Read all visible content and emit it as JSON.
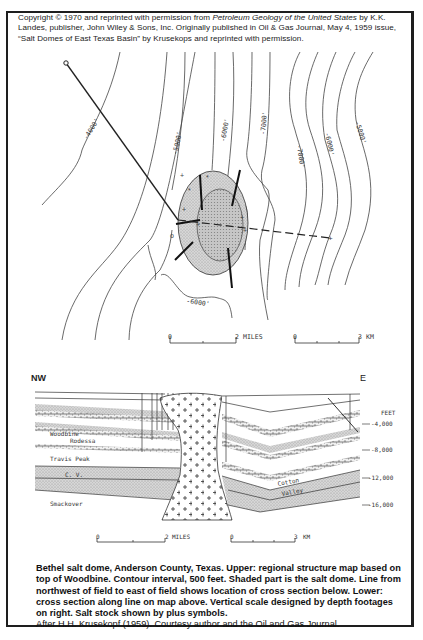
{
  "copyright": {
    "pre": "Copyright © 1970 and reprinted with permission from ",
    "title": "Petroleum Geology of the United States",
    "post": " by K.K. Landes, publisher, John Wiley & Sons, Inc. Originally published in Oil & Gas Journal, May 4, 1959 issue, “Salt Domes of East Texas Basin” by Krusekops and reprinted with permission."
  },
  "map": {
    "contour_labels": [
      "-4000'",
      "-5000'",
      "-6000'",
      "-7000'",
      "-7000'",
      "-6000'",
      "-5000'",
      "-6000'"
    ],
    "scale_miles": {
      "start": "0",
      "end": "2",
      "unit": "MILES"
    },
    "scale_km": {
      "start": "0",
      "end": "3",
      "unit": "KM"
    }
  },
  "cross_section": {
    "left_label": "NW",
    "right_label": "E",
    "depth_unit": "FEET",
    "depths": [
      "-4,000",
      "-8,000",
      "-12,000",
      "-16,000"
    ],
    "formations": [
      "Woodbine",
      "Rodessa",
      "Travis Peak",
      "C. V.",
      "Smackover",
      "Cotton",
      "Valley"
    ],
    "scale_miles": {
      "start": "0",
      "end": "2",
      "unit": "MILES"
    },
    "scale_km": {
      "start": "0",
      "end": "3",
      "unit": "KM"
    }
  },
  "caption": {
    "bold": "Bethel salt dome, Anderson County, Texas.  Upper: regional structure map based on top of Woodbine.  Contour interval, 500 feet.  Shaded part is the salt dome.    Line from northwest of field to east of field shows location of cross section below.  Lower: cross section along line on map above.  Vertical scale designed by depth footages on right.  Salt stock shown by plus symbols.",
    "normal": "After H.H. Krusekopf (1959).  Courtesy author and the Oil and Gas Journal."
  }
}
